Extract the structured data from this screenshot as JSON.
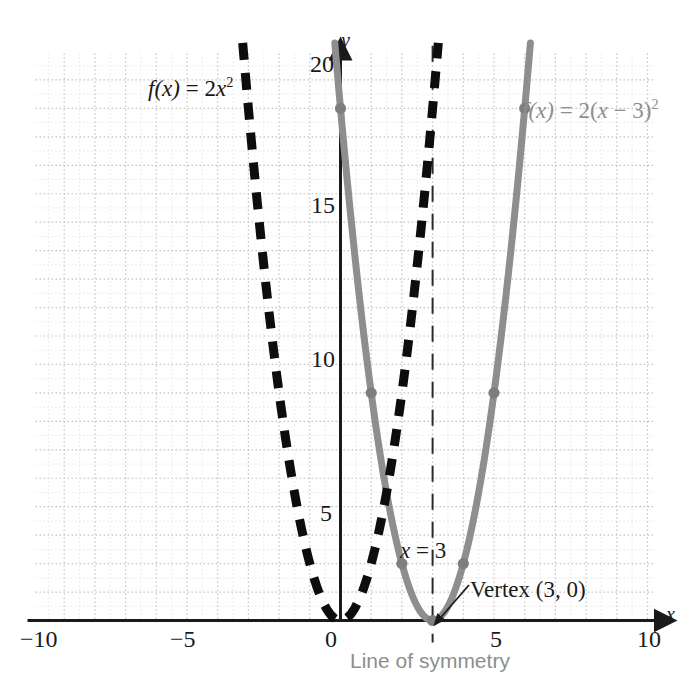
{
  "chart_data": {
    "type": "line",
    "title": "",
    "xlabel": "x",
    "ylabel": "y",
    "xlim": [
      -10,
      10
    ],
    "ylim": [
      0,
      20
    ],
    "grid": true,
    "grid_major_step": 1,
    "grid_minor_step": 0.5,
    "legend_position": "inline-annotations",
    "x_ticks": [
      -10,
      -5,
      0,
      5,
      10
    ],
    "x_tick_labels": [
      "−10",
      "−5",
      "0",
      "5",
      "10"
    ],
    "y_ticks": [
      5,
      10,
      15,
      20
    ],
    "y_tick_labels": [
      "5",
      "10",
      "15",
      "20"
    ],
    "series": [
      {
        "name": "f(x) = 2x²",
        "equation_html": "f(x) = 2x<sup>2</sup>",
        "style": "dashed",
        "color": "#0d0d0d",
        "width": 9,
        "vertex": [
          0,
          0
        ],
        "a": 2,
        "h": 0,
        "k": 0,
        "x": [
          -3.17,
          -3.0,
          -2.75,
          -2.5,
          -2.25,
          -2.0,
          -1.75,
          -1.5,
          -1.25,
          -1.0,
          -0.75,
          -0.5,
          -0.25,
          0,
          0.25,
          0.5,
          0.75,
          1.0,
          1.25,
          1.5,
          1.75,
          2.0,
          2.25,
          2.5,
          2.75,
          3.0,
          3.17
        ],
        "y": [
          20.1,
          18.0,
          15.125,
          12.5,
          10.125,
          8.0,
          6.125,
          4.5,
          3.125,
          2.0,
          1.125,
          0.5,
          0.125,
          0,
          0.125,
          0.5,
          1.125,
          2.0,
          3.125,
          4.5,
          6.125,
          8.0,
          10.125,
          12.5,
          15.125,
          18.0,
          20.1
        ]
      },
      {
        "name": "f(x) = 2(x − 3)²",
        "equation_html": "f(x) = 2(x − 3)<sup>2</sup>",
        "style": "solid",
        "color": "#8e8e8e",
        "width": 7,
        "vertex": [
          3,
          0
        ],
        "a": 2,
        "h": 3,
        "k": 0,
        "x": [
          -0.17,
          0,
          0.25,
          0.5,
          0.75,
          1.0,
          1.25,
          1.5,
          1.75,
          2.0,
          2.25,
          2.5,
          2.75,
          3.0,
          3.25,
          3.5,
          3.75,
          4.0,
          4.25,
          4.5,
          4.75,
          5.0,
          5.25,
          5.5,
          5.75,
          6.0,
          6.17
        ],
        "y": [
          20.1,
          18.0,
          15.125,
          12.5,
          10.125,
          8.0,
          6.125,
          4.5,
          3.125,
          2.0,
          1.125,
          0.5,
          0.125,
          0,
          0.125,
          0.5,
          1.125,
          2.0,
          3.125,
          4.5,
          6.125,
          8.0,
          10.125,
          12.5,
          15.125,
          18.0,
          20.1
        ],
        "marked_points": [
          {
            "x": 0,
            "y": 18
          },
          {
            "x": 1,
            "y": 8
          },
          {
            "x": 2,
            "y": 2
          },
          {
            "x": 3,
            "y": 0
          },
          {
            "x": 4,
            "y": 2
          },
          {
            "x": 5,
            "y": 8
          },
          {
            "x": 6,
            "y": 18
          }
        ]
      }
    ],
    "annotations": [
      {
        "name": "line-of-symmetry",
        "text": "x = 3",
        "at_x": 3,
        "type": "vertical-dashed-line",
        "color": "#2a2a2a"
      },
      {
        "name": "vertex-callout",
        "text": "Vertex (3, 0)",
        "points_to": [
          3,
          0
        ],
        "color": "#1a1a1a"
      },
      {
        "name": "symmetry-caption",
        "text": "Line of symmetry",
        "color": "#8e8e8e"
      }
    ]
  },
  "labels": {
    "fn_black_prefix": "f(x)",
    "fn_black_eq": " = ",
    "fn_black_coef": "2x",
    "fn_black_exp": "2",
    "fn_gray_prefix": "f(x)",
    "fn_gray_eq": " = ",
    "fn_gray_body": "2(x − 3)",
    "fn_gray_exp": "2",
    "x_axis_letter": "x",
    "y_axis_letter": "y",
    "x_eq_3_var": "x",
    "x_eq_3_rest": " = 3",
    "vertex_text": "Vertex (3, 0)",
    "line_of_symmetry": "Line of symmetry",
    "tick_neg10": "−10",
    "tick_neg5": "−5",
    "tick_0": "0",
    "tick_5": "5",
    "tick_10": "10",
    "tick_y5": "5",
    "tick_y10": "10",
    "tick_y15": "15",
    "tick_y20": "20"
  },
  "colors": {
    "gray_curve": "#8e8e8e",
    "black_curve": "#0d0d0d",
    "grid_minor": "#d8d8d8",
    "grid_major": "#c4c4c4",
    "axis": "#1a1a1a",
    "background": "#ffffff"
  }
}
